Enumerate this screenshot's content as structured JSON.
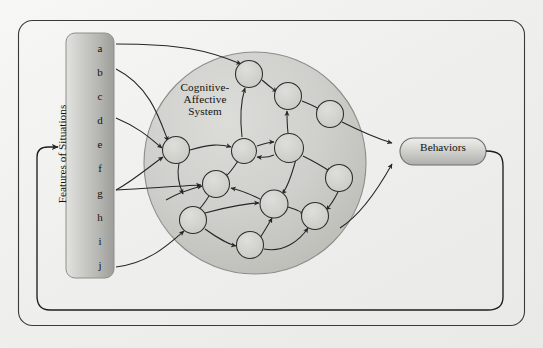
{
  "figure": {
    "background_color": "#f1f1ef",
    "stroke_color": "#2b2b2b",
    "box_fill_light": "#d9d9d6",
    "box_fill_dark": "#a8a8a4",
    "circle_fill": "#cdcdc9"
  },
  "outer_frame": {
    "name": "outer-frame",
    "x": 18,
    "y": 20,
    "width": 507,
    "height": 306,
    "radius": 14
  },
  "features_box": {
    "label": "Features of Situations",
    "items": [
      "a",
      "b",
      "c",
      "d",
      "e",
      "f",
      "g",
      "h",
      "i",
      "j"
    ],
    "x": 66,
    "y": 33,
    "width": 48,
    "height": 245,
    "radius": 9
  },
  "system": {
    "label": "Cognitive-\nAffective\nSystem",
    "cx": 255,
    "cy": 163,
    "r": 111
  },
  "behaviors_box": {
    "label": "Behaviors",
    "x": 400,
    "y": 138,
    "width": 86,
    "height": 27,
    "radius": 13
  },
  "nodes": [
    {
      "id": "n1",
      "cx": 176,
      "cy": 150,
      "r": 13.5
    },
    {
      "id": "n2",
      "cx": 249,
      "cy": 74,
      "r": 13.5
    },
    {
      "id": "n3",
      "cx": 288,
      "cy": 96,
      "r": 13.5
    },
    {
      "id": "n4",
      "cx": 330,
      "cy": 114,
      "r": 13.5
    },
    {
      "id": "n5",
      "cx": 244,
      "cy": 151,
      "r": 12.5
    },
    {
      "id": "n6",
      "cx": 289,
      "cy": 148,
      "r": 14.5
    },
    {
      "id": "n7",
      "cx": 216,
      "cy": 184,
      "r": 13.5
    },
    {
      "id": "n8",
      "cx": 339,
      "cy": 178,
      "r": 13.5
    },
    {
      "id": "n9",
      "cx": 274,
      "cy": 204,
      "r": 14.0
    },
    {
      "id": "n10",
      "cx": 315,
      "cy": 216,
      "r": 13.5
    },
    {
      "id": "n11",
      "cx": 193,
      "cy": 220,
      "r": 13.5
    },
    {
      "id": "n12",
      "cx": 250,
      "cy": 245,
      "r": 13.5
    }
  ],
  "input_links": [
    {
      "from": "a",
      "to": "n2"
    },
    {
      "from": "b",
      "to": "n1"
    },
    {
      "from": "d",
      "to": "n1"
    },
    {
      "from": "g",
      "to": "n1"
    },
    {
      "from": "g",
      "to": "n7"
    },
    {
      "from": "j",
      "to": "n11"
    }
  ],
  "output_links": [
    {
      "from": "n4",
      "to": "behaviors"
    },
    {
      "from": "n8",
      "to": "behaviors"
    }
  ],
  "feedback_loop": {
    "name": "behavior-feedback-loop",
    "description": "Behaviors output loops back around the bottom of the frame to Features of Situations"
  }
}
